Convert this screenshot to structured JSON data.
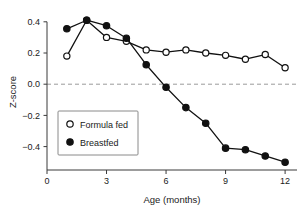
{
  "chart_data": {
    "type": "line",
    "title": "",
    "subtitle": "",
    "xlabel": "Age (months)",
    "ylabel": "Z-score",
    "x": [
      1,
      2,
      3,
      4,
      5,
      6,
      7,
      8,
      9,
      10,
      11,
      12
    ],
    "xlim": [
      0,
      12.6
    ],
    "ylim": [
      -0.55,
      0.45
    ],
    "xticks": [
      0,
      3,
      6,
      9,
      12
    ],
    "xtick_labels": [
      "0",
      "3",
      "6",
      "9",
      "12"
    ],
    "yticks": [
      0.4,
      0.2,
      0.0,
      -0.2,
      -0.4
    ],
    "ytick_labels": [
      "0.4",
      "0.2",
      "0.0",
      "-0.2",
      "-0.4"
    ],
    "grid": false,
    "reference_lines": [
      {
        "name": "zero-line",
        "orientation": "horizontal",
        "value": 0.0,
        "style": "dashed",
        "color": "#9a9a9a"
      }
    ],
    "legend_position": "lower-left-inside",
    "series": [
      {
        "name": "Formula fed",
        "marker": "open-circle",
        "color": "#111111",
        "values": [
          0.18,
          0.41,
          0.3,
          0.275,
          0.22,
          0.205,
          0.22,
          0.2,
          0.185,
          0.16,
          0.19,
          0.105
        ]
      },
      {
        "name": "Breastfed",
        "marker": "filled-circle",
        "color": "#111111",
        "values": [
          0.355,
          0.41,
          0.375,
          0.295,
          0.125,
          -0.02,
          -0.15,
          -0.25,
          -0.41,
          -0.42,
          -0.46,
          -0.5
        ]
      }
    ]
  },
  "legend": {
    "entries": [
      {
        "label": "Formula fed",
        "marker": "open-circle"
      },
      {
        "label": "Breastfed",
        "marker": "filled-circle"
      }
    ]
  },
  "axes": {
    "y_title": "Z-score",
    "x_title": "Age (months)"
  },
  "colors": {
    "ink": "#111111",
    "axis": "#3a3a3a",
    "reference": "#9a9a9a",
    "legend_border": "#8a8a8a",
    "background": "#ffffff"
  }
}
